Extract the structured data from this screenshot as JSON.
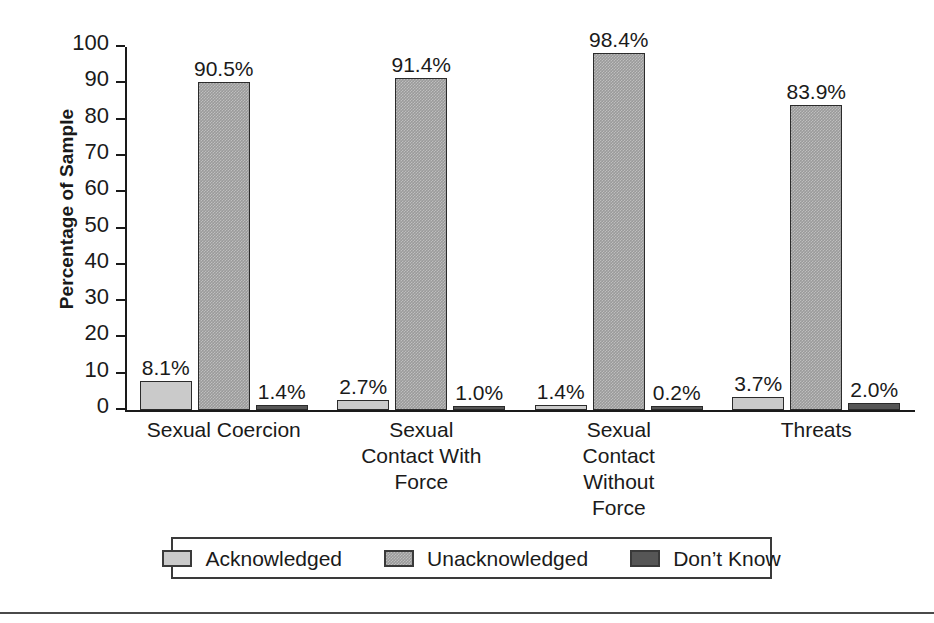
{
  "chart_data": {
    "type": "bar",
    "title": "",
    "xlabel": "",
    "ylabel": "Percentage of Sample",
    "ylim": [
      0,
      100
    ],
    "yticks": [
      0,
      10,
      20,
      30,
      40,
      50,
      60,
      70,
      80,
      90,
      100
    ],
    "ytick_labels": [
      "0",
      "10",
      "20",
      "30",
      "40",
      "50",
      "60",
      "70",
      "80",
      "90",
      "100"
    ],
    "grid": false,
    "legend_position": "bottom",
    "categories": [
      "Sexual Coercion",
      "Sexual Contact With Force",
      "Sexual Contact Without Force",
      "Threats"
    ],
    "category_lines": [
      [
        "Sexual Coercion"
      ],
      [
        "Sexual",
        "Contact With",
        "Force"
      ],
      [
        "Sexual",
        "Contact",
        "Without",
        "Force"
      ],
      [
        "Threats"
      ]
    ],
    "series": [
      {
        "name": "Acknowledged",
        "color": "#cacaca",
        "values": [
          8.1,
          2.7,
          1.4,
          3.7
        ],
        "labels": [
          "8.1%",
          "2.7%",
          "1.4%",
          "3.7%"
        ]
      },
      {
        "name": "Unacknowledged",
        "color": "#9a9a9a",
        "values": [
          90.5,
          91.4,
          98.4,
          83.9
        ],
        "labels": [
          "90.5%",
          "91.4%",
          "98.4%",
          "83.9%"
        ]
      },
      {
        "name": "Don’t Know",
        "color": "#565656",
        "values": [
          1.4,
          1.0,
          0.2,
          2.0
        ],
        "labels": [
          "1.4%",
          "1.0%",
          "0.2%",
          "2.0%"
        ]
      }
    ]
  },
  "axis": {
    "y_title": "Percentage of Sample"
  },
  "legend": {
    "items": [
      {
        "label": "Acknowledged",
        "swatch": "light-gray-swatch"
      },
      {
        "label": "Unacknowledged",
        "swatch": "medium-gray-swatch"
      },
      {
        "label": "Don’t Know",
        "swatch": "dark-gray-swatch"
      }
    ]
  },
  "colors": {
    "acknowledged": "#cacaca",
    "unacknowledged": "#9a9a9a",
    "dont_know": "#565656",
    "axis": "#1a1a1a",
    "text": "#1a1a1a"
  }
}
